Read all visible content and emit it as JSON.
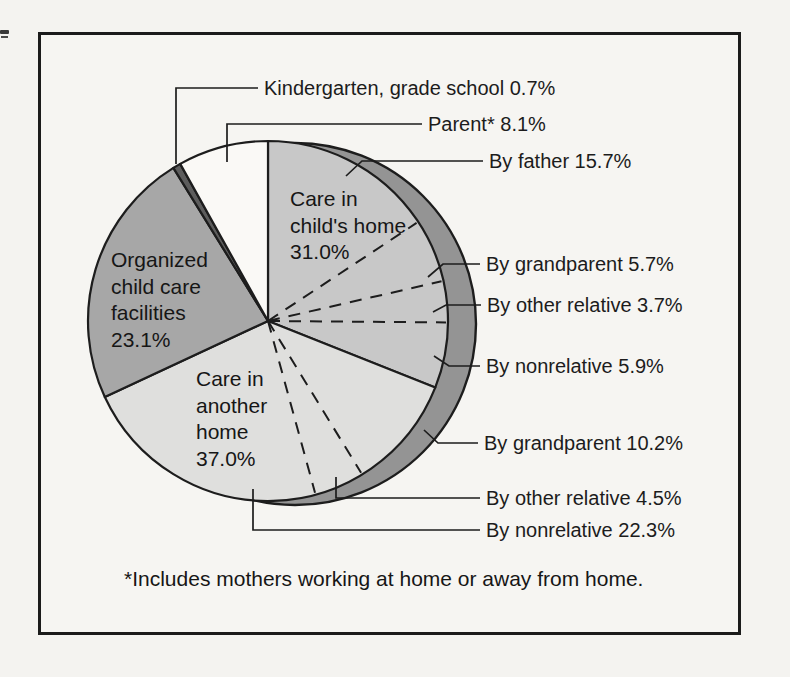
{
  "figure": {
    "footnote": "*Includes mothers working at home or away from home."
  },
  "chart_data": {
    "type": "pie",
    "title": "",
    "unit": "%",
    "start_angle_deg": 0,
    "direction": "clockwise",
    "outline_color": "#1d1d1d",
    "shadow_color": "#949494",
    "text_color": "#1c1c1c",
    "groups": [
      {
        "label": "Care in child's home",
        "value": 31.0,
        "color": "#c8c8c8",
        "children": [
          {
            "label": "By father",
            "value": 15.7
          },
          {
            "label": "By grandparent",
            "value": 5.7
          },
          {
            "label": "By other relative",
            "value": 3.7
          },
          {
            "label": "By nonrelative",
            "value": 5.9
          }
        ]
      },
      {
        "label": "Care in another home",
        "value": 37.0,
        "color": "#dfdfdd",
        "children": [
          {
            "label": "By grandparent",
            "value": 10.2
          },
          {
            "label": "By other relative",
            "value": 4.5
          },
          {
            "label": "By nonrelative",
            "value": 22.3
          }
        ]
      },
      {
        "label": "Organized child care facilities",
        "value": 23.1,
        "color": "#a7a7a7"
      },
      {
        "label": "Kindergarten, grade school",
        "value": 0.7,
        "color": "#5d5d5d"
      },
      {
        "label": "Parent*",
        "value": 8.1,
        "color": "#faf9f6"
      }
    ],
    "inside_labels": [
      {
        "lines": [
          "Care in",
          "child's home",
          "31.0%"
        ],
        "x": 290,
        "y": 186
      },
      {
        "lines": [
          "Organized",
          "child care",
          "facilities",
          "23.1%"
        ],
        "x": 111,
        "y": 247
      },
      {
        "lines": [
          "Care in",
          "another",
          "home",
          "37.0%"
        ],
        "x": 196,
        "y": 366
      }
    ],
    "callouts": [
      {
        "text": "Kindergarten, grade school 0.7%",
        "x": 264,
        "y": 88,
        "leader": [
          [
            258,
            88
          ],
          [
            176,
            88
          ],
          [
            176,
            164
          ]
        ]
      },
      {
        "text": "Parent* 8.1%",
        "x": 428,
        "y": 124,
        "leader": [
          [
            422,
            124
          ],
          [
            227,
            124
          ],
          [
            227,
            162
          ]
        ]
      },
      {
        "text": "By father 15.7%",
        "x": 489,
        "y": 161,
        "leader": [
          [
            483,
            161
          ],
          [
            362,
            161
          ],
          [
            346,
            176
          ]
        ]
      },
      {
        "text": "By grandparent 5.7%",
        "x": 486,
        "y": 264,
        "leader": [
          [
            480,
            264
          ],
          [
            443,
            264
          ],
          [
            428,
            277
          ]
        ]
      },
      {
        "text": "By other relative 3.7%",
        "x": 487,
        "y": 305,
        "leader": [
          [
            481,
            305
          ],
          [
            446,
            305
          ],
          [
            433,
            312
          ]
        ]
      },
      {
        "text": "By nonrelative 5.9%",
        "x": 486,
        "y": 366,
        "leader": [
          [
            480,
            366
          ],
          [
            449,
            366
          ],
          [
            434,
            356
          ]
        ]
      },
      {
        "text": "By grandparent 10.2%",
        "x": 484,
        "y": 443,
        "leader": [
          [
            478,
            443
          ],
          [
            438,
            443
          ],
          [
            424,
            430
          ]
        ]
      },
      {
        "text": "By other relative 4.5%",
        "x": 486,
        "y": 498,
        "leader": [
          [
            480,
            498
          ],
          [
            336,
            498
          ],
          [
            336,
            477
          ]
        ]
      },
      {
        "text": "By nonrelative 22.3%",
        "x": 486,
        "y": 530,
        "leader": [
          [
            480,
            530
          ],
          [
            253,
            530
          ],
          [
            253,
            489
          ]
        ]
      }
    ],
    "footnote": "*Includes mothers working at home or away from home."
  }
}
